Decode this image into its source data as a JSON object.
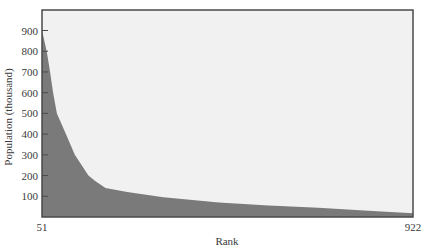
{
  "chart_data": {
    "type": "area",
    "title": "",
    "xlabel": "Rank",
    "ylabel": "Population (thousand)",
    "xlim": [
      51,
      922
    ],
    "ylim": [
      0,
      1000
    ],
    "x_tick_labels": [
      "51",
      "922"
    ],
    "y_ticks": [
      100,
      200,
      300,
      400,
      500,
      600,
      700,
      800,
      900
    ],
    "y_tick_labels": [
      "100",
      "200",
      "300",
      "400",
      "500",
      "600",
      "700",
      "800",
      "900"
    ],
    "grid": false,
    "legend": null,
    "colors": {
      "fill": "#7a7a7a",
      "background": "#f1f1f1",
      "frame": "#4a4a4a"
    },
    "series": [
      {
        "name": "Population by rank",
        "x": [
          51,
          53,
          62,
          70,
          77,
          86,
          107,
          128,
          160,
          175,
          200,
          251,
          336,
          466,
          583,
          700,
          817,
          922
        ],
        "values": [
          900,
          880,
          800,
          700,
          600,
          500,
          400,
          300,
          200,
          175,
          140,
          120,
          95,
          70,
          55,
          45,
          30,
          18
        ]
      }
    ]
  }
}
